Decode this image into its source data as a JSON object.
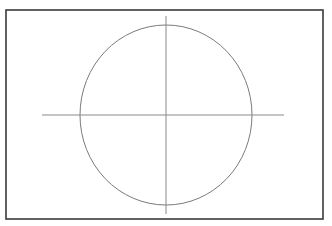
{
  "diagram": {
    "type": "circle-with-center-lines",
    "canvas": {
      "width": 332,
      "height": 226,
      "background": "#ffffff"
    },
    "frame": {
      "x": 6,
      "y": 10,
      "width": 317,
      "height": 209,
      "stroke": "#3a3a3a",
      "stroke_width": 1.6
    },
    "circle": {
      "cx": 166,
      "cy": 115,
      "rx": 86,
      "ry": 90,
      "stroke": "#7a7a7a",
      "stroke_width": 1,
      "fill": "none"
    },
    "center_lines": {
      "horizontal": {
        "x1": 42,
        "y1": 115,
        "x2": 284,
        "y2": 115,
        "stroke": "#8a8a8a",
        "stroke_width": 1
      },
      "vertical": {
        "x1": 166,
        "y1": 16,
        "x2": 166,
        "y2": 214,
        "stroke": "#8a8a8a",
        "stroke_width": 1
      }
    },
    "center_point": {
      "x": 166,
      "y": 115
    }
  }
}
